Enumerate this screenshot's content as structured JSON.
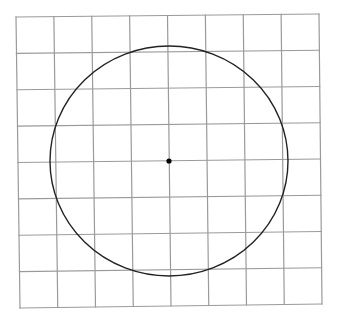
{
  "diagram": {
    "type": "grid-with-circle",
    "grid": {
      "rows": 8,
      "cols": 8,
      "line_color": "#9a9a9a",
      "line_width": 1.2,
      "corners": {
        "top_left": [
          16,
          17
        ],
        "top_right": [
          319,
          14
        ],
        "bottom_left": [
          20,
          308
        ],
        "bottom_right": [
          322,
          304
        ]
      }
    },
    "circle": {
      "center": [
        169,
        161
      ],
      "radius_x": 119,
      "radius_y": 115,
      "stroke_color": "#222222",
      "stroke_width": 1.4
    },
    "center_point": {
      "position": [
        169,
        161
      ],
      "radius": 2.6,
      "color": "#000000"
    }
  }
}
